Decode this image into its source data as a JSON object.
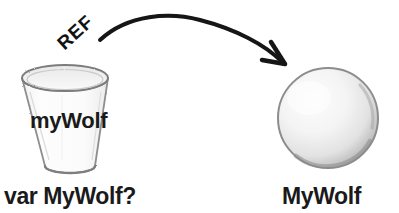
{
  "diagram": {
    "background_color": "#ffffff",
    "ink_color": "#1a1a1a",
    "labels": {
      "ref_tag": "REF",
      "cup_variable": "myWolf",
      "variable_caption_keyword": "var ",
      "variable_caption_name": "MyWolf?",
      "object_caption": "MyWolf"
    },
    "shapes": {
      "cup": {
        "name": "tumbler-cup",
        "fill": "#fbfbfb",
        "outline": "#8c8c8c",
        "rim_center_x": 65,
        "rim_center_y": 78,
        "rim_rx": 43,
        "rim_ry": 13,
        "base_center_x": 70,
        "base_center_y": 168,
        "base_rx": 25,
        "base_ry": 7
      },
      "sphere": {
        "name": "object-sphere",
        "fill_center": "#f7f7f7",
        "fill_edge": "#a8a8a8",
        "outline": "#8f8f8f",
        "center_x": 328,
        "center_y": 118,
        "radius": 50
      },
      "arrow": {
        "name": "reference-arrow",
        "color": "#141414",
        "stroke_width": 4,
        "start_x": 100,
        "start_y": 40,
        "peak_x": 186,
        "peak_y": 16,
        "end_x": 283,
        "end_y": 63
      }
    }
  }
}
